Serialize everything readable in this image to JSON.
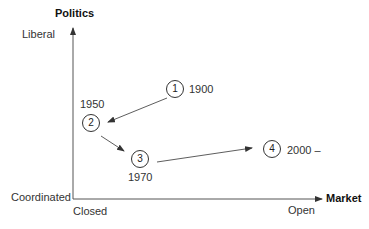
{
  "axes": {
    "y_title": "Politics",
    "y_top_label": "Liberal",
    "y_bottom_label": "Coordinated",
    "x_title": "Market",
    "x_left_label": "Closed",
    "x_right_label": "Open"
  },
  "nodes": [
    {
      "id": "1",
      "year": "1900"
    },
    {
      "id": "2",
      "year": "1950"
    },
    {
      "id": "3",
      "year": "1970"
    },
    {
      "id": "4",
      "year": "2000 –"
    }
  ],
  "colors": {
    "line": "#333333",
    "background": "#ffffff"
  }
}
